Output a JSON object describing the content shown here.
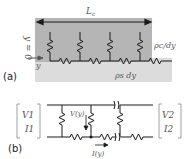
{
  "panel_a": {
    "label": "(a)",
    "length_label": "L",
    "length_sub": "c",
    "origin_label": "y = 0",
    "axis_label": "y",
    "contact_resistance_label": "ρc/dy",
    "sheet_resistance_label": "ρs dy",
    "colors": {
      "contact_region": "#b5b5b5",
      "sheet_region": "#dcdcdc",
      "wire": "#1a1a1a"
    }
  },
  "panel_b": {
    "label": "(b)",
    "left_port": {
      "v": "V1",
      "i": "I1"
    },
    "right_port": {
      "v": "V2",
      "i": "I2"
    },
    "voltage_label": "V(y)",
    "current_label": "I(y)"
  }
}
